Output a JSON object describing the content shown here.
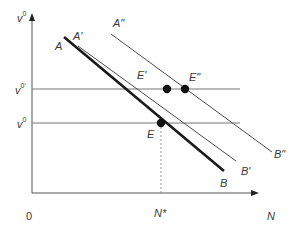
{
  "figure": {
    "y_axis_label": "v",
    "y_axis_label_sup": "0",
    "x_axis_label": "N",
    "origin_label": "0",
    "levels": [
      {
        "id": "v0prime",
        "label": "v",
        "sup": "0'"
      },
      {
        "id": "v0",
        "label": "v",
        "sup": "0"
      }
    ],
    "curves": [
      {
        "id": "AB",
        "start_label": "A",
        "end_label": "B",
        "weight": "thick"
      },
      {
        "id": "A1B1",
        "start_label": "A'",
        "end_label": "B'",
        "weight": "thin"
      },
      {
        "id": "A2B2",
        "start_label": "A\"",
        "end_label": "B\"",
        "weight": "thin"
      }
    ],
    "points": [
      {
        "id": "E",
        "label": "E"
      },
      {
        "id": "E1",
        "label": "E'"
      },
      {
        "id": "E2",
        "label": "E\""
      }
    ],
    "equilibrium_x_label": "N*",
    "colors": {
      "axis": "#555555",
      "thick_line": "#1a1a1a",
      "thin_line": "#4a4a4a",
      "level_line": "#777777",
      "dashed": "#999999",
      "point": "#111111",
      "text": "#3a3a3a"
    }
  }
}
